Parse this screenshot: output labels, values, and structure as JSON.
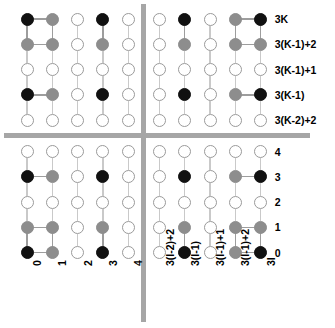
{
  "figure": {
    "colors": {
      "black": "#111111",
      "gray": "#8d8d8d",
      "white": "#ffffff",
      "edge": "#9d9d9d",
      "separator": "#a6a6a6"
    },
    "row_labels": [
      "3K",
      "3(K-1)+2",
      "3(K-1)+1",
      "3(K-1)",
      "3(K-2)+2",
      "4",
      "3",
      "2",
      "1",
      "0"
    ],
    "column_labels": [
      "0",
      "1",
      "2",
      "3",
      "4",
      "3(I-2)+2",
      "3(I-1)",
      "3(I-1)+1",
      "3(I-1)+2",
      "3I"
    ],
    "node_states": [
      [
        "black",
        "gray",
        "white",
        "black",
        "white",
        "white",
        "black",
        "white",
        "gray",
        "black"
      ],
      [
        "gray",
        "gray",
        "white",
        "gray",
        "white",
        "white",
        "gray",
        "white",
        "gray",
        "gray"
      ],
      [
        "white",
        "white",
        "white",
        "white",
        "white",
        "white",
        "white",
        "white",
        "white",
        "white"
      ],
      [
        "black",
        "gray",
        "white",
        "black",
        "white",
        "white",
        "black",
        "white",
        "gray",
        "black"
      ],
      [
        "white",
        "white",
        "white",
        "white",
        "white",
        "white",
        "white",
        "white",
        "white",
        "white"
      ],
      [
        "white",
        "white",
        "white",
        "white",
        "white",
        "white",
        "white",
        "white",
        "white",
        "white"
      ],
      [
        "black",
        "gray",
        "white",
        "black",
        "white",
        "white",
        "black",
        "white",
        "gray",
        "black"
      ],
      [
        "white",
        "white",
        "white",
        "white",
        "white",
        "white",
        "white",
        "white",
        "white",
        "white"
      ],
      [
        "gray",
        "gray",
        "white",
        "gray",
        "white",
        "white",
        "gray",
        "white",
        "gray",
        "gray"
      ],
      [
        "black",
        "gray",
        "white",
        "black",
        "white",
        "white",
        "black",
        "white",
        "gray",
        "black"
      ]
    ],
    "separator_rows_after": 4,
    "separator_cols_after": 4
  }
}
